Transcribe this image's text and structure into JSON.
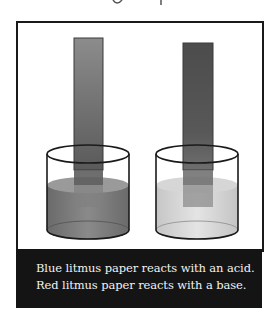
{
  "figure": {
    "beakers": [
      {
        "id": "left",
        "strip_color": "#8a8a8a",
        "strip_color_bottom": "#5e5e5e",
        "liquid_color": "#7d7d7d",
        "liquid_dark": "#5a5a5a"
      },
      {
        "id": "right",
        "strip_color": "#4e4e4e",
        "strip_color_bottom": "#6a6a6a",
        "liquid_color": "#d4d4d4",
        "liquid_dark": "#b8b8b8"
      }
    ],
    "frame_color": "#1a1a1a"
  },
  "caption": {
    "line1": "Blue litmus paper reacts with an acid.",
    "line2": "Red litmus paper reacts with a base.",
    "background": "#141414",
    "text_color": "#f2f2f2"
  }
}
